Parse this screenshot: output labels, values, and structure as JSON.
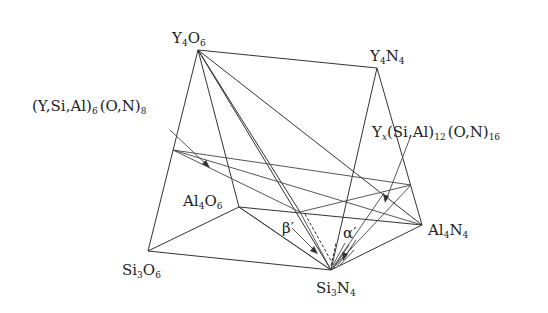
{
  "diagram": {
    "vertices": {
      "Y4O6": {
        "label": "Y",
        "sub1": "4",
        "mid": "O",
        "sub2": "6"
      },
      "Y4N4": {
        "label": "Y",
        "sub1": "4",
        "mid": "N",
        "sub2": "4"
      },
      "Si3O6": {
        "label": "Si",
        "sub1": "3",
        "mid": "O",
        "sub2": "6"
      },
      "Al4O6": {
        "label": "Al",
        "sub1": "4",
        "mid": "O",
        "sub2": "6"
      },
      "Si3N4": {
        "label": "Si",
        "sub1": "3",
        "mid": "N",
        "sub2": "4"
      },
      "Al4N4": {
        "label": "Al",
        "sub1": "4",
        "mid": "N",
        "sub2": "4"
      }
    },
    "annotations": {
      "beta_plane": {
        "main": "(Y,Si,Al)",
        "sub1": "6",
        "mid": "(O,N)",
        "sub2": "8"
      },
      "alpha_plane": {
        "y": "Y",
        "x_sub": "x",
        "main": "(Si,Al)",
        "sub1": "12",
        "mid": "(O,N)",
        "sub2": "16"
      },
      "beta_symbol": "β′",
      "alpha_symbol": "α′"
    }
  }
}
